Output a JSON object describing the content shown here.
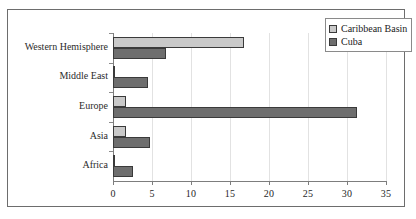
{
  "chart_data": {
    "type": "bar",
    "orientation": "horizontal",
    "title": "",
    "xlabel": "",
    "ylabel": "",
    "categories": [
      "Western Hemisphere",
      "Middle East",
      "Europe",
      "Asia",
      "Africa"
    ],
    "series": [
      {
        "name": "Caribbean Basin",
        "color": "#c9c9c9",
        "values": [
          16.8,
          0.3,
          1.7,
          1.7,
          0.2
        ]
      },
      {
        "name": "Cuba",
        "color": "#6e6e6e",
        "values": [
          6.8,
          4.5,
          31.3,
          4.7,
          2.5
        ]
      }
    ],
    "xlim": [
      0,
      35
    ],
    "xticks": [
      0,
      5,
      10,
      15,
      20,
      25,
      30,
      35
    ],
    "xtick_labels": [
      "0",
      "5",
      "10",
      "15",
      "20",
      "25",
      "30",
      "35"
    ],
    "grid": true,
    "legend_position": "top-right"
  },
  "legend": {
    "entries": [
      {
        "label": "Caribbean Basin"
      },
      {
        "label": "Cuba"
      }
    ]
  }
}
